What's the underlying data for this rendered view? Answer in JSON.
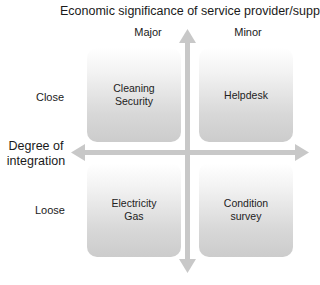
{
  "diagram": {
    "title": "Economic significance of service provider/supplier",
    "columns": [
      {
        "label": "Major"
      },
      {
        "label": "Minor"
      }
    ],
    "rows": [
      {
        "label": "Close"
      },
      {
        "label": "Loose"
      }
    ],
    "y_axis_label_line1": "Degree of",
    "y_axis_label_line2": "integration",
    "quadrants": {
      "close_major": {
        "line1": "Cleaning",
        "line2": "Security"
      },
      "close_minor": {
        "line1": "Helpdesk",
        "line2": ""
      },
      "loose_major": {
        "line1": "Electricity",
        "line2": "Gas"
      },
      "loose_minor": {
        "line1": "Condition",
        "line2": "survey"
      }
    },
    "colors": {
      "arrow": "#c8c8c8",
      "box_top": "#ffffff",
      "box_bottom": "#cccccc",
      "text": "#1a1a1a"
    }
  }
}
